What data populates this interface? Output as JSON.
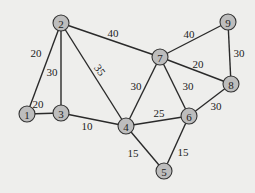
{
  "graph": {
    "nodes": [
      {
        "id": "1",
        "x": 27,
        "y": 114
      },
      {
        "id": "2",
        "x": 61,
        "y": 23
      },
      {
        "id": "3",
        "x": 61,
        "y": 113
      },
      {
        "id": "4",
        "x": 126,
        "y": 126
      },
      {
        "id": "5",
        "x": 164,
        "y": 171
      },
      {
        "id": "6",
        "x": 189,
        "y": 116
      },
      {
        "id": "7",
        "x": 160,
        "y": 57
      },
      {
        "id": "8",
        "x": 231,
        "y": 84
      },
      {
        "id": "9",
        "x": 228,
        "y": 22
      }
    ],
    "edges": [
      {
        "from": "1",
        "to": "2",
        "weight": "20",
        "lx": 36,
        "ly": 53
      },
      {
        "from": "1",
        "to": "3",
        "weight": "20",
        "lx": 38,
        "ly": 104
      },
      {
        "from": "2",
        "to": "3",
        "weight": "30",
        "lx": 52,
        "ly": 72
      },
      {
        "from": "2",
        "to": "4",
        "weight": "35",
        "lx": 100,
        "ly": 70
      },
      {
        "from": "2",
        "to": "7",
        "weight": "40",
        "lx": 113,
        "ly": 33
      },
      {
        "from": "3",
        "to": "4",
        "weight": "10",
        "lx": 87,
        "ly": 126
      },
      {
        "from": "4",
        "to": "7",
        "weight": "30",
        "lx": 136,
        "ly": 86
      },
      {
        "from": "4",
        "to": "6",
        "weight": "25",
        "lx": 159,
        "ly": 113
      },
      {
        "from": "4",
        "to": "5",
        "weight": "15",
        "lx": 133,
        "ly": 153
      },
      {
        "from": "6",
        "to": "5",
        "weight": "15",
        "lx": 183,
        "ly": 152
      },
      {
        "from": "6",
        "to": "7",
        "weight": "30",
        "lx": 188,
        "ly": 86
      },
      {
        "from": "6",
        "to": "8",
        "weight": "30",
        "lx": 216,
        "ly": 106
      },
      {
        "from": "7",
        "to": "8",
        "weight": "20",
        "lx": 198,
        "ly": 64
      },
      {
        "from": "7",
        "to": "9",
        "weight": "40",
        "lx": 189,
        "ly": 34
      },
      {
        "from": "9",
        "to": "8",
        "weight": "30",
        "lx": 239,
        "ly": 53
      }
    ]
  }
}
